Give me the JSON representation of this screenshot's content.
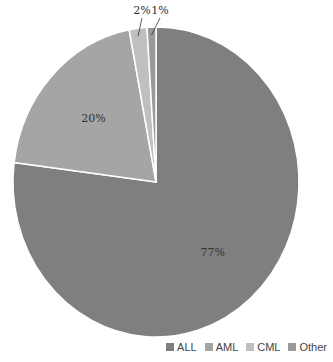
{
  "chart_data": {
    "type": "pie",
    "title": "",
    "categories": [
      "ALL",
      "AML",
      "CML",
      "Other"
    ],
    "values": [
      77,
      20,
      2,
      1
    ],
    "labels": [
      "77%",
      "20%",
      "2%",
      "1%"
    ],
    "colors": [
      "#7f7f7f",
      "#a5a5a5",
      "#bfbfbf",
      "#999999"
    ],
    "legend_position": "bottom-right"
  },
  "legend": [
    {
      "label": "ALL",
      "color": "#7f7f7f"
    },
    {
      "label": "AML",
      "color": "#a5a5a5"
    },
    {
      "label": "CML",
      "color": "#bfbfbf"
    },
    {
      "label": "Other",
      "color": "#999999"
    }
  ]
}
